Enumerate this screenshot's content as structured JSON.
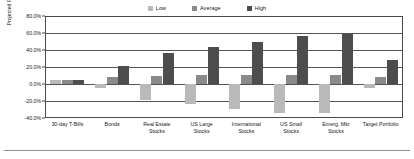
{
  "chart_data": {
    "type": "bar",
    "title": "",
    "xlabel": "",
    "ylabel": "Projected Return",
    "ylim": [
      -40,
      80
    ],
    "ytick_labels": [
      "80.0%",
      "60.0%",
      "40.0%",
      "20.0%",
      "0.0%",
      "-20.0%",
      "-40.0%"
    ],
    "ytick_values": [
      80,
      60,
      40,
      20,
      0,
      -20,
      -40
    ],
    "grid": true,
    "legend_position": "top-center",
    "categories": [
      "30-day T-Bills",
      "Bonds",
      "Real Estate Stocks",
      "US Large Stocks",
      "International Stocks",
      "US Small Stocks",
      "Emerg. Mkt Stocks",
      "Target Portfolio"
    ],
    "category_lines": [
      [
        "30-day T-Bills"
      ],
      [
        "Bonds"
      ],
      [
        "Real Estate",
        "Stocks"
      ],
      [
        "US Large",
        "Stocks"
      ],
      [
        "International",
        "Stocks"
      ],
      [
        "US Small",
        "Stocks"
      ],
      [
        "Emerg. Mkt",
        "Stocks"
      ],
      [
        "Target Portfolio"
      ]
    ],
    "series": [
      {
        "name": "Low",
        "color": "#b9b9b9",
        "values": [
          5,
          -5,
          -19,
          -24,
          -29,
          -34,
          -34,
          -5
        ]
      },
      {
        "name": "Average",
        "color": "#8a8a8a",
        "values": [
          5,
          8,
          9,
          11,
          11,
          11,
          11,
          8
        ]
      },
      {
        "name": "High",
        "color": "#4d4d4d",
        "values": [
          5,
          21,
          37,
          44,
          50,
          57,
          59,
          28
        ]
      }
    ]
  },
  "legend": {
    "entries": [
      {
        "label": "Low",
        "swatch": "legend-swatch-low"
      },
      {
        "label": "Average",
        "swatch": "legend-swatch-average"
      },
      {
        "label": "High",
        "swatch": "legend-swatch-high"
      }
    ]
  },
  "colors": {
    "low": "#b9b9b9",
    "average": "#8a8a8a",
    "high": "#4d4d4d",
    "axis": "#4a4a4a",
    "grid": "#555555",
    "background": "#ffffff"
  }
}
